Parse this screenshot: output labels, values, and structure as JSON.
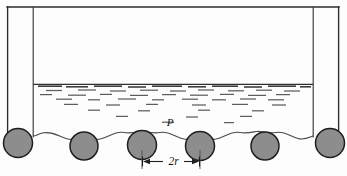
{
  "figure": {
    "type": "technical-line-diagram",
    "labels": {
      "pressure_label": "P",
      "spacing_label": "2r"
    },
    "colors": {
      "outline": "#2b2b2b",
      "sphere_fill": "#8d8d8d",
      "sphere_outline": "#1e1e1e",
      "liquid_hatch": "#5d5d5d",
      "background": "#fdfdfd"
    },
    "geometry": {
      "vessel_top_y": 7,
      "vessel_left_outer_x": 7,
      "vessel_left_inner_x": 33,
      "vessel_right_inner_x": 313,
      "vessel_right_outer_x": 339,
      "liquid_surface_y": 84,
      "sphere_radius": 14,
      "sphere_center_y": 145,
      "sphere_centers_x": [
        18,
        84,
        142,
        200,
        265,
        330
      ],
      "dimension_from_x": 142,
      "dimension_to_x": 200,
      "dimension_y": 161
    }
  }
}
